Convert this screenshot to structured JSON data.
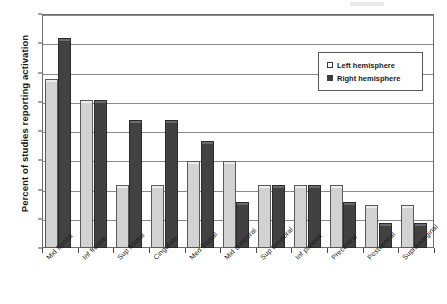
{
  "chart_data": {
    "type": "bar",
    "title": "",
    "xlabel": "",
    "ylabel": "Percent of studies reporting activation",
    "ylim": [
      0,
      80
    ],
    "ytick_step": 10,
    "yticks": [
      0,
      10,
      20,
      30,
      40,
      50,
      60,
      70,
      80
    ],
    "grid": true,
    "legend_position": "upper right",
    "categories": [
      "Mid frontal",
      "Inf frontal",
      "Sup frontal",
      "Cingulate",
      "Med frontal",
      "Mid temporal",
      "Sup temporal",
      "Inf parietal",
      "Precentral",
      "Postcentral",
      "Supramarginal"
    ],
    "series": [
      {
        "name": "Left hemisphere",
        "color": "#d2d2d2",
        "values": [
          57,
          50,
          21,
          21,
          29,
          29,
          21,
          21,
          21,
          14,
          14
        ]
      },
      {
        "name": "Right hemisphere",
        "color": "#414141",
        "values": [
          71,
          50,
          43,
          43,
          36,
          15,
          21,
          21,
          15,
          8,
          8
        ]
      }
    ]
  },
  "axes": {
    "y_title": "Percent of studies reporting activation",
    "y_tick_labels": [
      "0",
      "10",
      "20",
      "30",
      "40",
      "50",
      "60",
      "70",
      "80"
    ]
  },
  "legend": {
    "items": [
      {
        "label": "Left hemisphere",
        "swatch": "legend-swatch-left"
      },
      {
        "label": "Right hemisphere",
        "swatch": "legend-swatch-right"
      }
    ]
  }
}
